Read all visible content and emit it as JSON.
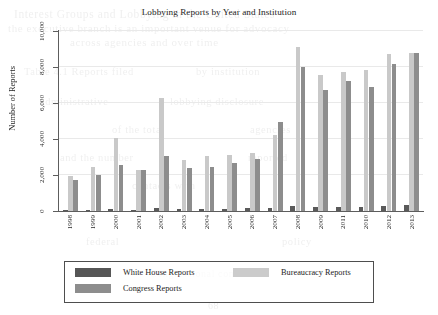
{
  "chart_data": {
    "type": "bar",
    "title": "Lobbying Reports by Year and Institution",
    "xlabel": "",
    "ylabel": "Number of Reports",
    "ylim": [
      0,
      10000
    ],
    "yticks": [
      0,
      2000,
      4000,
      6000,
      8000,
      10000
    ],
    "ytick_labels": [
      "0",
      "2,000",
      "4,000",
      "6,000",
      "8,000",
      "10,000"
    ],
    "grid": true,
    "legend_position": "below-axes",
    "categories": [
      "1998",
      "1999",
      "2000",
      "2001",
      "2002",
      "2003",
      "2004",
      "2005",
      "2006",
      "2007",
      "2008",
      "2009",
      "2011",
      "2010",
      "2012",
      "2013"
    ],
    "series": [
      {
        "name": "White House Reports",
        "color": "#5a5a5a",
        "values": [
          60,
          60,
          90,
          80,
          190,
          90,
          130,
          100,
          150,
          170,
          290,
          230,
          250,
          250,
          300,
          320
        ]
      },
      {
        "name": "Bureaucracy Reports",
        "color": "#c9c9c9",
        "values": [
          1930,
          2470,
          4080,
          2280,
          6300,
          2860,
          3060,
          3120,
          3210,
          4200,
          9100,
          7550,
          7700,
          7850,
          8750,
          8800
        ]
      },
      {
        "name": "Congress Reports",
        "color": "#8d8d8d",
        "values": [
          1720,
          2000,
          2580,
          2280,
          3030,
          2400,
          2420,
          2680,
          2880,
          4940,
          8000,
          6700,
          7250,
          6900,
          8150,
          8800
        ]
      }
    ]
  },
  "legend": {
    "entries": [
      {
        "label": "White House Reports",
        "swatch": "wh"
      },
      {
        "label": "Bureaucracy Reports",
        "swatch": "bur"
      },
      {
        "label": "Congress Reports",
        "swatch": "cong"
      }
    ]
  },
  "ghost_text": {
    "lines": [
      {
        "text": "Interest Groups  and  Lobbying  in  the  United  States",
        "x": 14,
        "y": 8,
        "size": 11.5
      },
      {
        "text": "the executive branch is  an important venue  for  advocacy",
        "x": 8,
        "y": 22,
        "size": 11
      },
      {
        "text": "across  agencies  and  over  time",
        "x": 70,
        "y": 36,
        "size": 11
      },
      {
        "text": "Table 4.1  Reports  filed",
        "x": 24,
        "y": 66,
        "size": 10.5
      },
      {
        "text": "by  institution",
        "x": 196,
        "y": 66,
        "size": 10.5
      },
      {
        "text": "administrative",
        "x": 40,
        "y": 96,
        "size": 10.5
      },
      {
        "text": "lobbying  disclosure",
        "x": 170,
        "y": 96,
        "size": 10.5
      },
      {
        "text": "of  the  total",
        "x": 112,
        "y": 124,
        "size": 10.5
      },
      {
        "text": "agencies",
        "x": 250,
        "y": 124,
        "size": 10.5
      },
      {
        "text": "and  the  number",
        "x": 60,
        "y": 152,
        "size": 10.5
      },
      {
        "text": "reported",
        "x": 248,
        "y": 152,
        "size": 10.5
      },
      {
        "text": "contacts  with",
        "x": 132,
        "y": 180,
        "size": 10.5
      },
      {
        "text": "federal",
        "x": 86,
        "y": 236,
        "size": 10.5
      },
      {
        "text": "policy",
        "x": 282,
        "y": 236,
        "size": 10.5
      },
      {
        "text": "Congressional  committees",
        "x": 150,
        "y": 268,
        "size": 10
      },
      {
        "text": "68",
        "x": 208,
        "y": 300,
        "size": 10
      }
    ]
  }
}
